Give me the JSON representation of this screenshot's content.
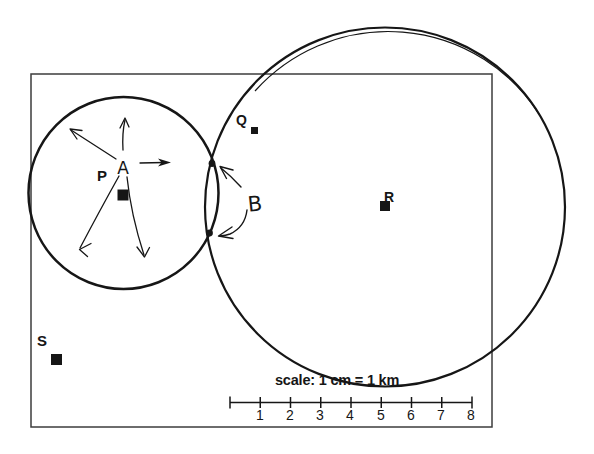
{
  "colors": {
    "ink": "#161616",
    "boundary": "#3d3d3d",
    "background": "#ffffff"
  },
  "diagram": {
    "point_labels": {
      "p": "P",
      "q": "Q",
      "r": "R",
      "s": "S"
    },
    "region_labels": {
      "a": "A",
      "b": "B"
    },
    "scale_bar": {
      "caption": "scale: 1 cm = 1 km",
      "tick_labels": [
        "1",
        "2",
        "3",
        "4",
        "5",
        "6",
        "7",
        "8"
      ]
    }
  }
}
